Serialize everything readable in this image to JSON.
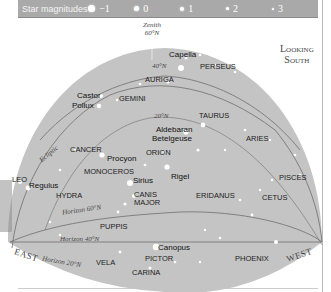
{
  "legend": {
    "title": "Star magnitudes",
    "magnitudes": [
      "−1",
      "0",
      "1",
      "2",
      "3"
    ]
  },
  "view": {
    "looking_line1": "Looking",
    "looking_line2": "South"
  },
  "zenith": {
    "line1": "Zenith",
    "line2": "60°N"
  },
  "lines": {
    "lat40": "40°N",
    "lat20": "20°N",
    "ecliptic": "Ecliptic",
    "horizon60": "Horizon 60°N",
    "horizon40": "Horizon 40°N",
    "horizon20": "Horizon 20°N"
  },
  "directions": {
    "east": "EAST",
    "west": "WEST"
  },
  "stars": {
    "capella": "Capella",
    "castor": "Castor",
    "pollux": "Pollux",
    "aldebaran": "Aldebaran",
    "betelgeuse": "Betelgeuse",
    "procyon": "Procyon",
    "sirius": "Sirius",
    "rigel": "Rigel",
    "regulus": "Regulus",
    "canopus": "Canopus"
  },
  "constellations": {
    "perseus": "PERSEUS",
    "auriga": "AURIGA",
    "gemini": "GEMINI",
    "taurus": "TAURUS",
    "aries": "ARIES",
    "cancer": "CANCER",
    "orion": "ORION",
    "monoceros": "MONOCEROS",
    "leo": "LEO",
    "hydra": "HYDRA",
    "canis_major_1": "CANIS",
    "canis_major_2": "MAJOR",
    "eridanus": "ERIDANUS",
    "pisces": "PISCES",
    "cetus": "CETUS",
    "puppis": "PUPPIS",
    "vela": "VELA",
    "pictor": "PICTOR",
    "carina": "CARINA",
    "phoenix": "PHOENIX"
  },
  "colors": {
    "sky": "#c4c4c4",
    "legend_bg": "#a9a9a9",
    "lines": "#6e6e6e"
  }
}
